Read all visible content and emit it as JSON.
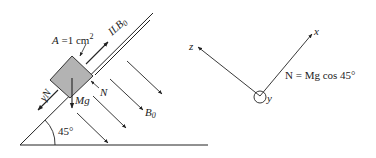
{
  "figure": {
    "left_panel": {
      "incline_angle_label": "45°",
      "area_label_prefix": "A",
      "area_label_eq": " =1 cm",
      "area_label_sup": "2",
      "current_label": "ILB",
      "current_label_sub": "0",
      "friction_label": "γN",
      "normal_label": "N",
      "weight_label": "Mg",
      "field_label": "B",
      "field_label_sub": "0"
    },
    "right_panel": {
      "axis_x": "x",
      "axis_y": "y",
      "axis_z": "z",
      "equation": "N = Mg cos 45°"
    },
    "colors": {
      "line": "#222222",
      "block_fill": "#b3b3b3",
      "block_stroke": "#333333"
    }
  }
}
